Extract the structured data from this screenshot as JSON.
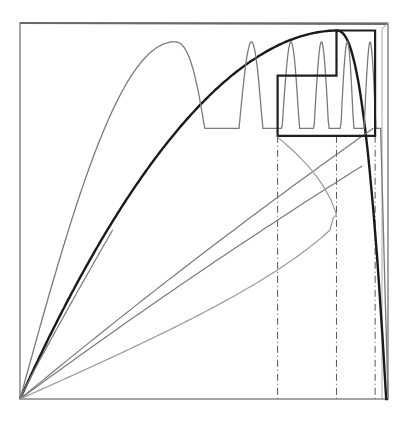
{
  "diagram": {
    "type": "cobweb-iteration-plot",
    "frame": {
      "x0": 20,
      "y0": 399,
      "x1": 388,
      "y1": 23
    },
    "colors": {
      "background": "#ffffff",
      "frame": "#6a6a6a",
      "thick_curve": "#1a1a1a",
      "thin_curve": "#7a7a7a",
      "light_curve": "#9a9a9a",
      "cobweb": "#1f1f1f",
      "dashed": "#555555"
    },
    "curves": [
      {
        "name": "f-iterate-1",
        "kind": "thick",
        "peak_x": 0.86,
        "peak_y": 0.98,
        "sharpness": 4.0
      },
      {
        "name": "f-iterate-2",
        "kind": "thin",
        "initial_slope": 2.2
      },
      {
        "name": "f-iterate-3",
        "kind": "thin-oscillating",
        "peaks": 3
      },
      {
        "name": "ray-1",
        "kind": "thin",
        "end_x": 0.96,
        "end_y": 0.72
      },
      {
        "name": "ray-2",
        "kind": "thin",
        "end_x": 0.93,
        "end_y": 0.62
      },
      {
        "name": "loop-curve",
        "kind": "light",
        "turn_x": 0.965,
        "turn_y": 0.48
      }
    ],
    "cobweb": {
      "points": [
        [
          0.7,
          0.7
        ],
        [
          0.7,
          0.86
        ],
        [
          0.86,
          0.86
        ],
        [
          0.86,
          0.98
        ],
        [
          0.965,
          0.98
        ],
        [
          0.965,
          0.7
        ],
        [
          0.7,
          0.7
        ]
      ]
    },
    "dashed_verticals": [
      0.7,
      0.86,
      0.965
    ],
    "dashed_from_y": 0.7
  }
}
